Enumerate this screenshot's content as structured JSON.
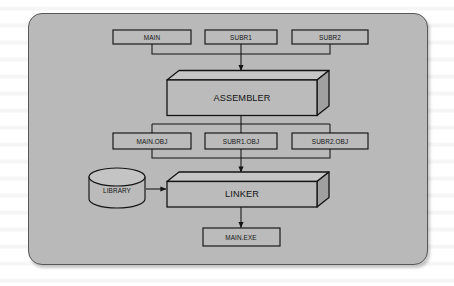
{
  "figure": {
    "kind": "flowchart",
    "panel": {
      "background_color": "#b9b9b9",
      "border_color": "#58585a",
      "page_background_color": "#ffffff"
    },
    "colors": {
      "box_fill": "#b9b9b9",
      "box_stroke": "#141414",
      "box_top_face": "#c6c6c6",
      "box_side_face": "#9e9e9e",
      "line": "#141414",
      "text": "#141414"
    },
    "source_files": [
      {
        "label": "MAIN",
        "shape": "rectangle"
      },
      {
        "label": "SUBR1",
        "shape": "rectangle"
      },
      {
        "label": "SUBR2",
        "shape": "rectangle"
      }
    ],
    "assembler": {
      "label": "ASSEMBLER",
      "shape": "3d-box"
    },
    "object_files": [
      {
        "label": "MAIN.OBJ",
        "shape": "rectangle"
      },
      {
        "label": "SUBR1.OBJ",
        "shape": "rectangle"
      },
      {
        "label": "SUBR2.OBJ",
        "shape": "rectangle"
      }
    ],
    "library": {
      "label": "LIBRARY",
      "shape": "cylinder"
    },
    "linker": {
      "label": "LINKER",
      "shape": "3d-box"
    },
    "executable": {
      "label": "MAIN.EXE",
      "shape": "rectangle"
    },
    "connections": [
      {
        "from": "MAIN",
        "to": "ASSEMBLER",
        "style": "bus"
      },
      {
        "from": "SUBR1",
        "to": "ASSEMBLER",
        "style": "bus"
      },
      {
        "from": "SUBR2",
        "to": "ASSEMBLER",
        "style": "bus"
      },
      {
        "from": "ASSEMBLER",
        "to": "MAIN.OBJ",
        "style": "bus"
      },
      {
        "from": "ASSEMBLER",
        "to": "SUBR1.OBJ",
        "style": "bus"
      },
      {
        "from": "ASSEMBLER",
        "to": "SUBR2.OBJ",
        "style": "bus"
      },
      {
        "from": "MAIN.OBJ",
        "to": "LINKER",
        "style": "bus"
      },
      {
        "from": "SUBR1.OBJ",
        "to": "LINKER",
        "style": "bus"
      },
      {
        "from": "SUBR2.OBJ",
        "to": "LINKER",
        "style": "bus"
      },
      {
        "from": "LIBRARY",
        "to": "LINKER",
        "style": "arrow"
      },
      {
        "from": "LINKER",
        "to": "MAIN.EXE",
        "style": "arrow"
      }
    ]
  }
}
